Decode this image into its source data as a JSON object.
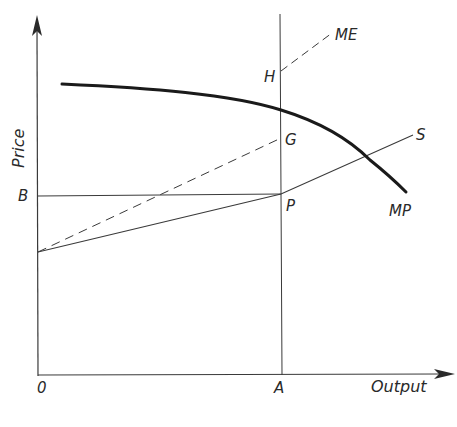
{
  "diagram": {
    "type": "economics-diagram",
    "axes": {
      "y_label": "Price",
      "x_label": "Output",
      "origin_label": "0"
    },
    "points": {
      "A": "A",
      "B": "B",
      "P": "P",
      "G": "G",
      "H": "H"
    },
    "curves": {
      "mp": "MP",
      "s": "S",
      "me": "ME"
    },
    "colors": {
      "ink": "#2a2a2a",
      "mp_curve": "#1a1a1a",
      "background": "#ffffff"
    }
  }
}
